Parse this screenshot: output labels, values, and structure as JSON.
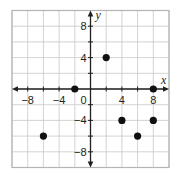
{
  "chart_data": {
    "type": "scatter",
    "title": "",
    "xlabel": "x",
    "ylabel": "y",
    "xlim": [
      -10,
      10
    ],
    "ylim": [
      -10,
      10
    ],
    "grid": true,
    "grid_step": 2,
    "legend": null,
    "x_ticks": [
      -8,
      -4,
      0,
      4,
      8
    ],
    "x_tick_labels": [
      "−8",
      "−4",
      "0",
      "4",
      "8"
    ],
    "y_ticks": [
      -8,
      -4,
      4,
      8
    ],
    "y_tick_labels": [
      "−8",
      "−4",
      "4",
      "8"
    ],
    "origin_label": "0",
    "points": [
      {
        "x": -6,
        "y": -6
      },
      {
        "x": -2,
        "y": 0
      },
      {
        "x": 2,
        "y": 4
      },
      {
        "x": 4,
        "y": -4
      },
      {
        "x": 6,
        "y": -6
      },
      {
        "x": 8,
        "y": 0
      },
      {
        "x": 8,
        "y": -4
      }
    ],
    "colors": {
      "grid": "#c8c8c8",
      "border": "#b4b4b4",
      "axis": "#231f20",
      "point": "#111111"
    }
  }
}
